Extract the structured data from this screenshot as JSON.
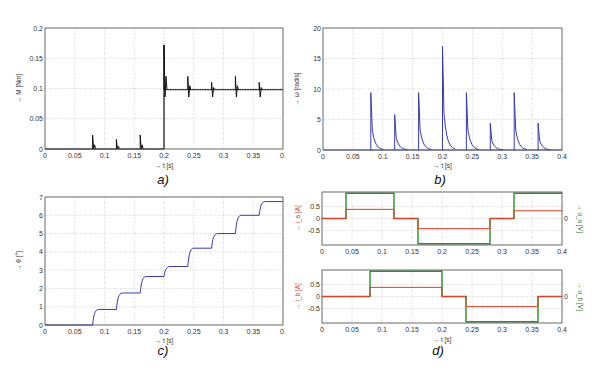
{
  "chart_data": [
    {
      "id": "a",
      "type": "line",
      "caption": "a)",
      "xlabel": "→ t [s]",
      "ylabel": "→ M [Nm]",
      "xlim": [
        0,
        0.4
      ],
      "ylim": [
        0,
        0.2
      ],
      "xticks": [
        "0",
        "0.05",
        "0.1",
        "0.15",
        "0.2",
        "0.25",
        "0.3",
        "0.35",
        "0."
      ],
      "yticks": [
        "0",
        "0.05",
        "0.1",
        "0.15",
        "0.2"
      ],
      "grid": true,
      "color": "#111111",
      "description": "Torque: ~0 until t=0.2 with small spikes at 0.08,0.12,0.16; step to 0.1 at t=0.2 with spike to 0.17; further spikes at 0.24,0.28,0.32,0.36",
      "spikes": [
        {
          "t": 0.08,
          "peak": 0.023
        },
        {
          "t": 0.12,
          "peak": 0.016
        },
        {
          "t": 0.16,
          "peak": 0.023
        },
        {
          "t": 0.2,
          "peak": 0.172
        },
        {
          "t": 0.24,
          "peak": 0.12
        },
        {
          "t": 0.28,
          "peak": 0.11
        },
        {
          "t": 0.32,
          "peak": 0.12
        },
        {
          "t": 0.36,
          "peak": 0.11
        }
      ],
      "baseline": [
        {
          "t0": 0,
          "t1": 0.2,
          "v": 0
        },
        {
          "t0": 0.2,
          "t1": 0.4,
          "v": 0.098
        }
      ]
    },
    {
      "id": "b",
      "type": "line",
      "caption": "b)",
      "xlabel": "→ t [s]",
      "ylabel": "→ ω [rad/s]",
      "xlim": [
        0,
        0.4
      ],
      "ylim": [
        0,
        20
      ],
      "xticks": [
        "0",
        "0.05",
        "0.1",
        "0.15",
        "0.2",
        "0.25",
        "0.3",
        "0.35",
        "0.4"
      ],
      "yticks": [
        "0",
        "5",
        "10",
        "15",
        "20"
      ],
      "grid": true,
      "color": "#3a3aa8",
      "spikes": [
        {
          "t": 0.08,
          "peak": 9.4
        },
        {
          "t": 0.12,
          "peak": 5.8
        },
        {
          "t": 0.16,
          "peak": 9.4
        },
        {
          "t": 0.2,
          "peak": 17.0
        },
        {
          "t": 0.24,
          "peak": 9.4
        },
        {
          "t": 0.28,
          "peak": 4.4
        },
        {
          "t": 0.32,
          "peak": 9.4
        },
        {
          "t": 0.36,
          "peak": 4.4
        }
      ]
    },
    {
      "id": "c",
      "type": "line",
      "caption": "c)",
      "xlabel": "→ t [s]",
      "ylabel": "→ θ [°]",
      "xlim": [
        0,
        0.4
      ],
      "ylim": [
        0,
        7
      ],
      "xticks": [
        "0",
        "0.05",
        "0.1",
        "0.15",
        "0.2",
        "0.25",
        "0.3",
        "0.35",
        "0."
      ],
      "yticks": [
        "0",
        "1",
        "2",
        "3",
        "4",
        "5",
        "6",
        "7"
      ],
      "grid": true,
      "color": "#3a3aa8",
      "steps": [
        {
          "t": 0.08,
          "v": 0.85
        },
        {
          "t": 0.12,
          "v": 1.75
        },
        {
          "t": 0.16,
          "v": 2.65
        },
        {
          "t": 0.2,
          "v": 3.2
        },
        {
          "t": 0.24,
          "v": 4.2
        },
        {
          "t": 0.28,
          "v": 5.0
        },
        {
          "t": 0.32,
          "v": 6.0
        },
        {
          "t": 0.36,
          "v": 6.75
        }
      ]
    },
    {
      "id": "d_top",
      "type": "line",
      "caption": "d)",
      "ylabel_left": "→ i_a [A]",
      "ylabel_right": "→ u_a [V]",
      "xlim": [
        0,
        0.4
      ],
      "ylim": [
        -1.1,
        1.1
      ],
      "xticks": [
        "0",
        "0.05",
        "0.1",
        "0.15",
        "0.2",
        "0.25",
        "0.3",
        "0.35",
        "0.4"
      ],
      "yticks_left": [
        "0.5",
        "0",
        "-0.5"
      ],
      "yticks_right": [
        "0"
      ],
      "grid": true,
      "series": [
        {
          "name": "i_a",
          "color": "#d9402a",
          "segments": [
            {
              "t0": 0,
              "t1": 0.04,
              "v": 0
            },
            {
              "t0": 0.04,
              "t1": 0.12,
              "v": 0.38
            },
            {
              "t0": 0.12,
              "t1": 0.16,
              "v": 0
            },
            {
              "t0": 0.16,
              "t1": 0.28,
              "v": -0.42
            },
            {
              "t0": 0.28,
              "t1": 0.32,
              "v": 0
            },
            {
              "t0": 0.32,
              "t1": 0.4,
              "v": 0.32
            }
          ]
        },
        {
          "name": "u_a",
          "color": "#2e8b2e",
          "segments": [
            {
              "t0": 0,
              "t1": 0.04,
              "v": 0
            },
            {
              "t0": 0.04,
              "t1": 0.12,
              "v": 1.05
            },
            {
              "t0": 0.12,
              "t1": 0.16,
              "v": 0
            },
            {
              "t0": 0.16,
              "t1": 0.28,
              "v": -1.05
            },
            {
              "t0": 0.28,
              "t1": 0.32,
              "v": 0
            },
            {
              "t0": 0.32,
              "t1": 0.4,
              "v": 1.05
            }
          ]
        }
      ]
    },
    {
      "id": "d_bottom",
      "type": "line",
      "xlabel": "→ t [s]",
      "ylabel_left": "→ i_b [A]",
      "ylabel_right": "→ u_b [V]",
      "xlim": [
        0,
        0.4
      ],
      "ylim": [
        -1.1,
        1.1
      ],
      "xticks": [
        "0",
        "0.05",
        "0.1",
        "0.15",
        "0.2",
        "0.25",
        "0.3",
        "0.35",
        "0.4"
      ],
      "yticks_left": [
        "0.5",
        "0",
        "-0.5"
      ],
      "yticks_right": [
        "0"
      ],
      "grid": true,
      "series": [
        {
          "name": "i_b",
          "color": "#d9402a",
          "segments": [
            {
              "t0": 0,
              "t1": 0.08,
              "v": 0
            },
            {
              "t0": 0.08,
              "t1": 0.2,
              "v": 0.38
            },
            {
              "t0": 0.2,
              "t1": 0.24,
              "v": 0
            },
            {
              "t0": 0.24,
              "t1": 0.36,
              "v": -0.42
            },
            {
              "t0": 0.36,
              "t1": 0.4,
              "v": 0
            }
          ]
        },
        {
          "name": "u_b",
          "color": "#2e8b2e",
          "segments": [
            {
              "t0": 0,
              "t1": 0.08,
              "v": 0
            },
            {
              "t0": 0.08,
              "t1": 0.2,
              "v": 1.05
            },
            {
              "t0": 0.2,
              "t1": 0.24,
              "v": 0
            },
            {
              "t0": 0.24,
              "t1": 0.36,
              "v": -1.05
            },
            {
              "t0": 0.36,
              "t1": 0.4,
              "v": 0
            }
          ]
        }
      ]
    }
  ],
  "layout": {
    "a": {
      "x0": 45,
      "x1": 283,
      "y0": 28,
      "y1": 149,
      "cap_x": 163,
      "cap_y": 184,
      "xlab_y": 168
    },
    "b": {
      "x0": 323,
      "x1": 562,
      "y0": 28,
      "y1": 150,
      "cap_x": 440,
      "cap_y": 184,
      "xlab_y": 168
    },
    "c": {
      "x0": 45,
      "x1": 283,
      "y0": 197,
      "y1": 325,
      "cap_x": 163,
      "cap_y": 355,
      "xlab_y": 343
    },
    "d_top": {
      "x0": 322,
      "x1": 562,
      "y0": 192,
      "y1": 245
    },
    "d_bottom": {
      "x0": 322,
      "x1": 562,
      "y0": 270,
      "y1": 323,
      "cap_x": 438,
      "cap_y": 355,
      "xlab_y": 342
    }
  }
}
